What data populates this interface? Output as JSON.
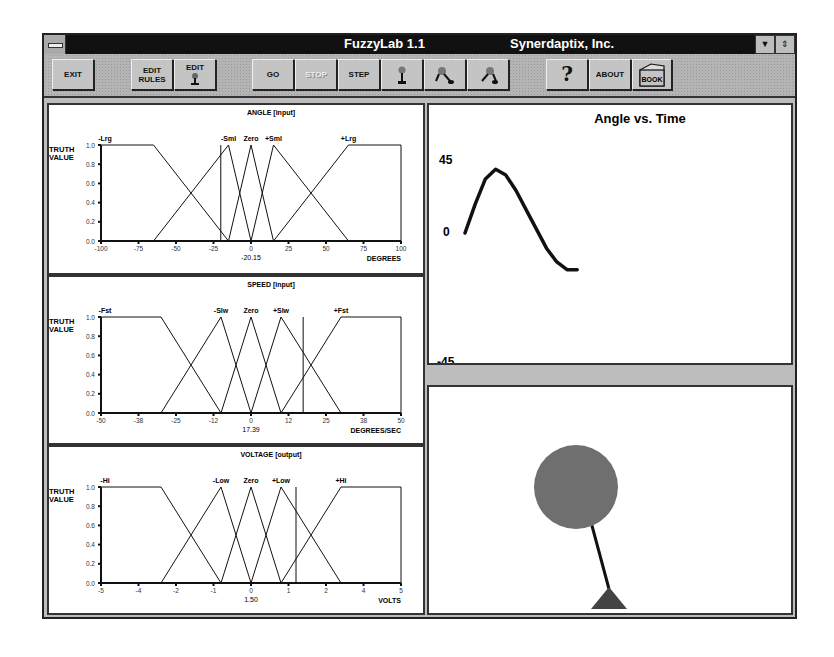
{
  "window": {
    "title": "FuzzyLab 1.1",
    "company": "Synerdaptix, Inc.",
    "controls": {
      "minimize": "▼",
      "restore": "⇕"
    }
  },
  "toolbar": {
    "buttons": [
      {
        "id": "exit",
        "label": "EXIT",
        "icon": null,
        "enabled": true
      },
      {
        "id": "edit-rules",
        "label": "EDIT\nRULES",
        "icon": null,
        "enabled": true
      },
      {
        "id": "edit-pendulum",
        "label": "EDIT",
        "icon": "pendulum-icon",
        "enabled": true
      },
      {
        "id": "go",
        "label": "GO",
        "icon": null,
        "enabled": true
      },
      {
        "id": "stop",
        "label": "STOP",
        "icon": null,
        "enabled": false
      },
      {
        "id": "step",
        "label": "STEP",
        "icon": null,
        "enabled": true
      },
      {
        "id": "pendulum-upright",
        "label": "",
        "icon": "pendulum-upright-icon",
        "enabled": true
      },
      {
        "id": "pendulum-left",
        "label": "",
        "icon": "pendulum-left-icon",
        "enabled": true
      },
      {
        "id": "pendulum-right",
        "label": "",
        "icon": "pendulum-right-icon",
        "enabled": true
      },
      {
        "id": "help",
        "label": "?",
        "icon": "help-icon",
        "enabled": true
      },
      {
        "id": "about",
        "label": "ABOUT",
        "icon": null,
        "enabled": true
      },
      {
        "id": "book",
        "label": "BOOK",
        "icon": "book-icon",
        "enabled": true
      }
    ]
  },
  "chart_data": [
    {
      "type": "line",
      "title": "ANGLE [input]",
      "ylabel": "TRUTH VALUE",
      "xlabel": "DEGREES",
      "xlim": [
        -100,
        100
      ],
      "ylim": [
        0,
        1
      ],
      "x_ticks": [
        "-100",
        "-75",
        "-50",
        "-25",
        "0",
        "25",
        "50",
        "75",
        "100"
      ],
      "y_ticks": [
        "0.0",
        "0.2",
        "0.4",
        "0.6",
        "0.8",
        "1.0"
      ],
      "current_value": "-20.15",
      "current_x": -20.15,
      "sets": [
        {
          "name": "-Lrg",
          "points": [
            [
              -100,
              1
            ],
            [
              -65,
              1
            ],
            [
              -15,
              0
            ]
          ]
        },
        {
          "name": "-Sml",
          "points": [
            [
              -65,
              0
            ],
            [
              -15,
              1
            ],
            [
              0,
              0
            ]
          ]
        },
        {
          "name": "Zero",
          "points": [
            [
              -15,
              0
            ],
            [
              0,
              1
            ],
            [
              15,
              0
            ]
          ]
        },
        {
          "name": "+Sml",
          "points": [
            [
              0,
              0
            ],
            [
              15,
              1
            ],
            [
              65,
              0
            ]
          ]
        },
        {
          "name": "+Lrg",
          "points": [
            [
              15,
              0
            ],
            [
              65,
              1
            ],
            [
              100,
              1
            ]
          ]
        }
      ]
    },
    {
      "type": "line",
      "title": "SPEED [input]",
      "ylabel": "TRUTH VALUE",
      "xlabel": "DEGREES/SEC",
      "xlim": [
        -50,
        50
      ],
      "ylim": [
        0,
        1
      ],
      "x_ticks": [
        "-50",
        "-38",
        "-25",
        "-12",
        "0",
        "12",
        "25",
        "38",
        "50"
      ],
      "y_ticks": [
        "0.0",
        "0.2",
        "0.4",
        "0.6",
        "0.8",
        "1.0"
      ],
      "current_value": "17.39",
      "current_x": 17.39,
      "sets": [
        {
          "name": "-Fst",
          "points": [
            [
              -50,
              1
            ],
            [
              -30,
              1
            ],
            [
              -10,
              0
            ]
          ]
        },
        {
          "name": "-Slw",
          "points": [
            [
              -30,
              0
            ],
            [
              -10,
              1
            ],
            [
              0,
              0
            ]
          ]
        },
        {
          "name": "Zero",
          "points": [
            [
              -10,
              0
            ],
            [
              0,
              1
            ],
            [
              10,
              0
            ]
          ]
        },
        {
          "name": "+Slw",
          "points": [
            [
              0,
              0
            ],
            [
              10,
              1
            ],
            [
              30,
              0
            ]
          ]
        },
        {
          "name": "+Fst",
          "points": [
            [
              10,
              0
            ],
            [
              30,
              1
            ],
            [
              50,
              1
            ]
          ]
        }
      ]
    },
    {
      "type": "line",
      "title": "VOLTAGE [output]",
      "ylabel": "TRUTH VALUE",
      "xlabel": "VOLTS",
      "xlim": [
        -5,
        5
      ],
      "ylim": [
        0,
        1
      ],
      "x_ticks": [
        "-5",
        "-4",
        "-2",
        "-1",
        "0",
        "1",
        "2",
        "4",
        "5"
      ],
      "y_ticks": [
        "0.0",
        "0.2",
        "0.4",
        "0.6",
        "0.8",
        "1.0"
      ],
      "current_value": "1.50",
      "current_x": 1.5,
      "sets": [
        {
          "name": "-Hi",
          "points": [
            [
              -5,
              1
            ],
            [
              -3,
              1
            ],
            [
              -1,
              0
            ]
          ]
        },
        {
          "name": "-Low",
          "points": [
            [
              -3,
              0
            ],
            [
              -1,
              1
            ],
            [
              0,
              0
            ]
          ]
        },
        {
          "name": "Zero",
          "points": [
            [
              -1,
              0
            ],
            [
              0,
              1
            ],
            [
              1,
              0
            ]
          ]
        },
        {
          "name": "+Low",
          "points": [
            [
              0,
              0
            ],
            [
              1,
              1
            ],
            [
              3,
              0
            ]
          ]
        },
        {
          "name": "+Hi",
          "points": [
            [
              1,
              0
            ],
            [
              3,
              1
            ],
            [
              5,
              1
            ]
          ]
        }
      ]
    },
    {
      "type": "line",
      "title": "Angle vs. Time",
      "y_ticks": [
        "45",
        "0",
        "-45"
      ],
      "ylim": [
        -45,
        45
      ],
      "series": [
        {
          "name": "angle",
          "x": [
            0,
            3,
            6,
            9,
            12,
            15,
            18,
            21,
            24,
            27,
            30,
            33
          ],
          "y": [
            0,
            15,
            28,
            33,
            30,
            22,
            12,
            2,
            -8,
            -15,
            -19,
            -19
          ]
        }
      ]
    }
  ],
  "simulation": {
    "label": "pendulum-view",
    "angle_deg": -20.15
  }
}
